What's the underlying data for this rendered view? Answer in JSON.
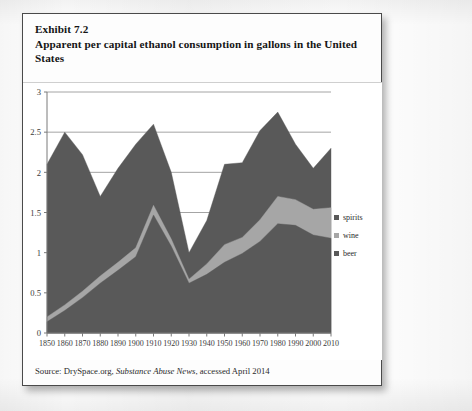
{
  "exhibit": {
    "number_label": "Exhibit 7.2",
    "title": "Apparent per capital ethanol consumption in gallons in the United",
    "title_cont": "States",
    "source_prefix": "Source: DrySpace.org, ",
    "source_italic": "Substance Abuse News",
    "source_suffix": ", accessed April 2014"
  },
  "legend": {
    "items": [
      {
        "label": "spirits",
        "color": "#595959"
      },
      {
        "label": "wine",
        "color": "#a6a6a6"
      },
      {
        "label": "beer",
        "color": "#595959"
      }
    ]
  },
  "colors": {
    "beer": "#595959",
    "wine": "#a6a6a6",
    "spirits": "#595959",
    "gridline": "#9a9a9a",
    "axis": "#7a7a7a",
    "frame_border": "#4a4a4a",
    "text": "#151515"
  },
  "chart_data": {
    "type": "area",
    "stacked": true,
    "title": "Apparent per capital ethanol consumption in gallons in the United States",
    "xlabel": "",
    "ylabel": "",
    "ylim": [
      0,
      3
    ],
    "yticks": [
      0,
      0.5,
      1,
      1.5,
      2,
      2.5,
      3
    ],
    "ytick_labels": [
      "0",
      "0.5",
      "1",
      "1.5",
      "2",
      "2.5",
      "3"
    ],
    "grid": true,
    "legend_position": "right",
    "categories": [
      1850,
      1860,
      1870,
      1880,
      1890,
      1900,
      1910,
      1920,
      1930,
      1940,
      1950,
      1960,
      1970,
      1980,
      1990,
      2000,
      2010
    ],
    "xtick_labels": [
      "1850",
      "1860",
      "1870",
      "1880",
      "1890",
      "1900",
      "1910",
      "1920",
      "1930",
      "1940",
      "1950",
      "1960",
      "1970",
      "1980",
      "1990",
      "2000",
      "2010"
    ],
    "series": [
      {
        "name": "beer",
        "color": "#595959",
        "values": [
          0.14,
          0.28,
          0.44,
          0.62,
          0.78,
          0.95,
          1.47,
          1.08,
          0.62,
          0.73,
          0.88,
          0.99,
          1.14,
          1.36,
          1.34,
          1.22,
          1.18
        ]
      },
      {
        "name": "wine",
        "color": "#a6a6a6",
        "values": [
          0.06,
          0.07,
          0.08,
          0.09,
          0.1,
          0.11,
          0.12,
          0.09,
          0.05,
          0.13,
          0.22,
          0.2,
          0.27,
          0.34,
          0.32,
          0.32,
          0.38
        ]
      },
      {
        "name": "spirits",
        "color": "#595959",
        "values": [
          1.9,
          2.15,
          1.7,
          0.99,
          1.17,
          1.29,
          1.01,
          0.83,
          0.33,
          0.54,
          1.0,
          0.93,
          1.11,
          1.05,
          0.69,
          0.51,
          0.74
        ]
      }
    ],
    "totals": [
      2.1,
      2.5,
      2.22,
      1.7,
      2.05,
      2.35,
      2.6,
      2.0,
      1.0,
      1.4,
      2.1,
      2.12,
      2.52,
      2.75,
      2.35,
      2.05,
      2.3
    ]
  }
}
